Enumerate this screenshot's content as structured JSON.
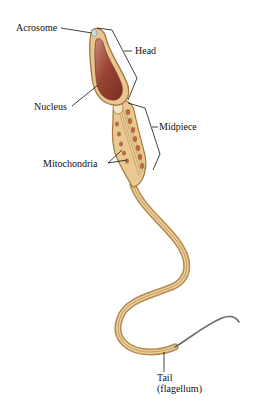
{
  "diagram": {
    "labels": {
      "acrosome": "Acrosome",
      "head": "Head",
      "nucleus": "Nucleus",
      "midpiece": "Midpiece",
      "mitochondria": "Mitochondria",
      "tail_line1": "Tail",
      "tail_line2": "(flagellum)"
    },
    "colors": {
      "background": "#ffffff",
      "membrane": "#d9b27a",
      "membrane_dark": "#a8763e",
      "nucleus": "#8e3a2c",
      "nucleus_light": "#c07a64",
      "mitochondria": "#b86a3a",
      "flagellum_end": "#6e6670",
      "leader_line": "#111111"
    }
  }
}
